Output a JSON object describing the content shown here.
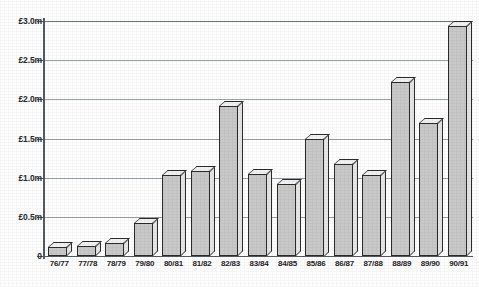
{
  "chart_data": {
    "type": "bar",
    "title": "",
    "subtitle": "",
    "xlabel": "",
    "ylabel": "",
    "categories": [
      "76/77",
      "77/78",
      "78/79",
      "79/80",
      "80/81",
      "81/82",
      "82/83",
      "83/84",
      "84/85",
      "85/86",
      "86/87",
      "87/88",
      "88/89",
      "89/90",
      "90/91"
    ],
    "values": [
      0.12,
      0.13,
      0.17,
      0.42,
      1.03,
      1.08,
      1.92,
      1.05,
      0.92,
      1.5,
      1.17,
      1.03,
      2.22,
      1.7,
      2.93
    ],
    "series": [
      {
        "name": "Amount",
        "values": [
          0.12,
          0.13,
          0.17,
          0.42,
          1.03,
          1.08,
          1.92,
          1.05,
          0.92,
          1.5,
          1.17,
          1.03,
          2.22,
          1.7,
          2.93
        ]
      }
    ],
    "ylim": [
      0,
      3.0
    ],
    "ytick_values": [
      0,
      0.5,
      1.0,
      1.5,
      2.0,
      2.5,
      3.0
    ],
    "ytick_labels": [
      "0",
      "£0.5m",
      "£1.0m",
      "£1.5m",
      "£2.0m",
      "£2.5m",
      "£3.0m"
    ],
    "grid": true,
    "grid_axis": "y",
    "legend": false,
    "legend_position": "none",
    "annotations": [],
    "style": {
      "bar_face_color": "#c9c9c9",
      "bar_top_color": "#f2f2f2",
      "bar_side_color": "#e6e6e6",
      "bar_outline_color": "#2b2b2b",
      "gridline_color": "#9aa0a6",
      "axis_color": "#555b60",
      "background_color": "#ffffff",
      "text_color": "#1f2225",
      "three_d": true
    }
  }
}
